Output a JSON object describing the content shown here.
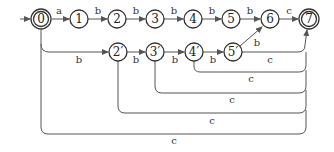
{
  "diagram": {
    "type": "finite-automaton",
    "start_state": "0",
    "accepting_states": [
      "0",
      "7"
    ],
    "states": [
      {
        "id": "0",
        "label": "0",
        "x": 41,
        "y": 19,
        "accepting": true,
        "start": true
      },
      {
        "id": "1",
        "label": "1",
        "x": 79,
        "y": 19
      },
      {
        "id": "2",
        "label": "2",
        "x": 117,
        "y": 19
      },
      {
        "id": "3",
        "label": "3",
        "x": 155,
        "y": 19
      },
      {
        "id": "4",
        "label": "4",
        "x": 193,
        "y": 19
      },
      {
        "id": "5",
        "label": "5",
        "x": 231,
        "y": 19
      },
      {
        "id": "6",
        "label": "6",
        "x": 270,
        "y": 19
      },
      {
        "id": "7",
        "label": "7",
        "x": 309,
        "y": 19,
        "accepting": true
      },
      {
        "id": "2p",
        "label": "2′",
        "x": 118,
        "y": 52
      },
      {
        "id": "3p",
        "label": "3′",
        "x": 155,
        "y": 52
      },
      {
        "id": "4p",
        "label": "4′",
        "x": 194,
        "y": 52
      },
      {
        "id": "5p",
        "label": "5′",
        "x": 233,
        "y": 52
      }
    ],
    "transitions": [
      {
        "from": "0",
        "to": "1",
        "label": "a"
      },
      {
        "from": "1",
        "to": "2",
        "label": "b"
      },
      {
        "from": "2",
        "to": "3",
        "label": "b"
      },
      {
        "from": "3",
        "to": "4",
        "label": "b"
      },
      {
        "from": "4",
        "to": "5",
        "label": "b"
      },
      {
        "from": "5",
        "to": "6",
        "label": "b"
      },
      {
        "from": "6",
        "to": "7",
        "label": "c"
      },
      {
        "from": "0",
        "to": "2p",
        "label": "b"
      },
      {
        "from": "2p",
        "to": "3p",
        "label": "b"
      },
      {
        "from": "3p",
        "to": "4p",
        "label": "b"
      },
      {
        "from": "4p",
        "to": "5p",
        "label": "b"
      },
      {
        "from": "5p",
        "to": "6",
        "label": "b"
      },
      {
        "from": "5p",
        "to": "7",
        "label": "c"
      },
      {
        "from": "4p",
        "to": "7",
        "label": "c"
      },
      {
        "from": "3p",
        "to": "7",
        "label": "c"
      },
      {
        "from": "2p",
        "to": "7",
        "label": "c"
      },
      {
        "from": "0",
        "to": "7",
        "label": "c"
      }
    ]
  },
  "labels": {
    "n0": "0",
    "n1": "1",
    "n2": "2",
    "n3": "3",
    "n4": "4",
    "n5": "5",
    "n6": "6",
    "n7": "7",
    "n2p": "2′",
    "n3p": "3′",
    "n4p": "4′",
    "n5p": "5′",
    "e01": "a",
    "e12": "b",
    "e23": "b",
    "e34": "b",
    "e45": "b",
    "e56": "b",
    "e67": "c",
    "e0_2p": "b",
    "e2p3p": "b",
    "e3p4p": "b",
    "e4p5p": "b",
    "e5p6": "b",
    "e5p7": "c",
    "e4p7": "c",
    "e3p7": "c",
    "e2p7": "c",
    "e07": "c"
  }
}
